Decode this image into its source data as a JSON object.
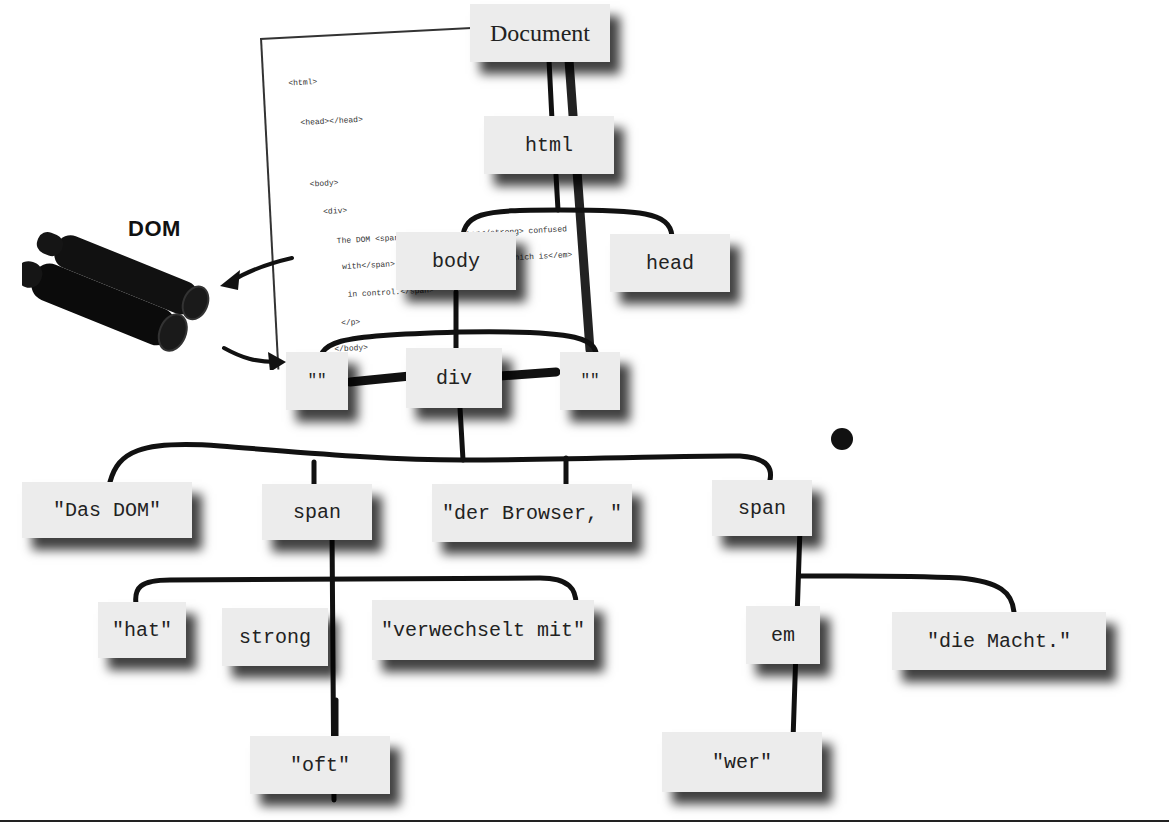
{
  "diagram": {
    "label": "DOM",
    "binoculars_icon": "binoculars-icon",
    "source_code": [
      "<html>",
      "<head></head>",
      "<body>",
      "<div>",
      "The DOM <span>is <strong>often</strong> confused",
      "with</span> the Browser, <span><em>which is</em>",
      "in control.</span>",
      "</p>",
      "</body>",
      "</html>"
    ],
    "nodes": {
      "document": "Document",
      "html": "html",
      "body": "body",
      "head": "head",
      "text_left": "\"\"",
      "div": "div",
      "text_right": "\"\"",
      "das_dom": "\"Das DOM\"",
      "span1": "span",
      "der_browser": "\"der Browser, \"",
      "span2": "span",
      "hat": "\"hat\"",
      "strong": "strong",
      "verwechselt": "\"verwechselt mit\"",
      "em": "em",
      "die_macht": "\"die Macht.\"",
      "oft": "\"oft\"",
      "wer": "\"wer\""
    },
    "edges": [
      [
        "document",
        "html"
      ],
      [
        "html",
        "body"
      ],
      [
        "html",
        "head"
      ],
      [
        "body",
        "text_left"
      ],
      [
        "body",
        "div"
      ],
      [
        "body",
        "text_right"
      ],
      [
        "div",
        "das_dom"
      ],
      [
        "div",
        "span1"
      ],
      [
        "div",
        "der_browser"
      ],
      [
        "div",
        "span2"
      ],
      [
        "span1",
        "hat"
      ],
      [
        "span1",
        "strong"
      ],
      [
        "span1",
        "verwechselt"
      ],
      [
        "span2",
        "em"
      ],
      [
        "span2",
        "die_macht"
      ],
      [
        "strong",
        "oft"
      ],
      [
        "em",
        "wer"
      ]
    ],
    "colors": {
      "node_bg": "#ececec",
      "line": "#111111",
      "background": "#ffffff"
    }
  }
}
